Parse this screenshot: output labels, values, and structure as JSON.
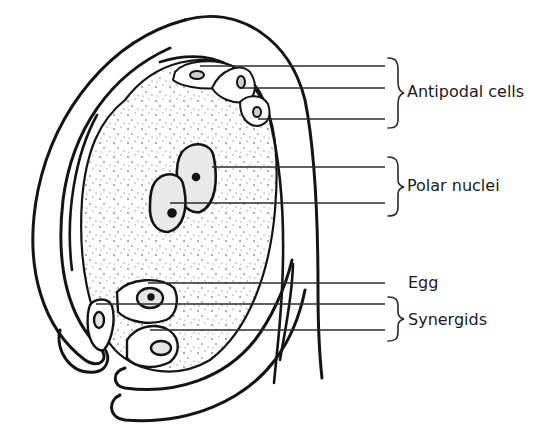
{
  "diagram": {
    "colors": {
      "ink": "#141414",
      "background": "#ffffff"
    },
    "labels": [
      {
        "id": "antipodal",
        "text": "Antipodal cells",
        "x": 407,
        "y": 84,
        "leaders_y": [
          66,
          88,
          119
        ],
        "bracket": true
      },
      {
        "id": "polar",
        "text": "Polar nuclei",
        "x": 407,
        "y": 178,
        "leaders_y": [
          167,
          203
        ],
        "bracket": true
      },
      {
        "id": "egg",
        "text": "Egg",
        "x": 408,
        "y": 275,
        "leaders_y": [
          283
        ],
        "bracket": false
      },
      {
        "id": "synergids",
        "text": "Synergids",
        "x": 408,
        "y": 312,
        "leaders_y": [
          304,
          330
        ],
        "bracket": true
      }
    ]
  }
}
